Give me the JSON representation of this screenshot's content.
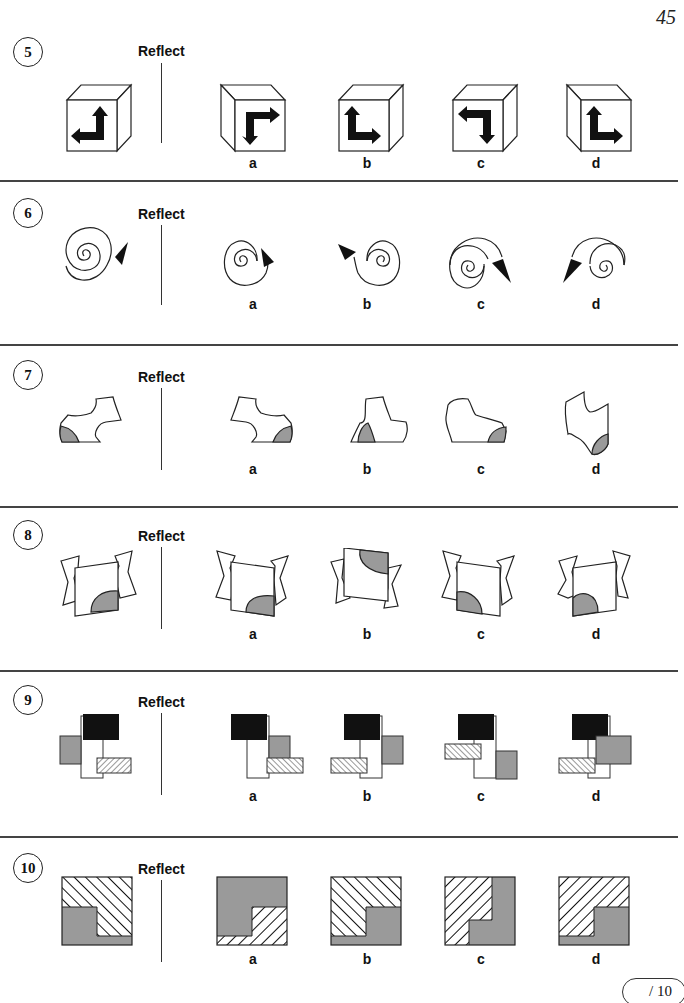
{
  "page": {
    "number": "45",
    "score_box": "/ 10"
  },
  "colors": {
    "shade_gray": "#9a9a9a",
    "black_fill": "#111111",
    "line": "#222222"
  },
  "questions": [
    {
      "number": "5",
      "instruction": "Reflect",
      "figure": "cube-with-L-arrow",
      "options": [
        {
          "label": "a"
        },
        {
          "label": "b"
        },
        {
          "label": "c"
        },
        {
          "label": "d"
        }
      ]
    },
    {
      "number": "6",
      "instruction": "Reflect",
      "figure": "spiral-with-arrowhead",
      "options": [
        {
          "label": "a"
        },
        {
          "label": "b"
        },
        {
          "label": "c"
        },
        {
          "label": "d"
        }
      ]
    },
    {
      "number": "7",
      "instruction": "Reflect",
      "figure": "curved-shape-with-shaded-corner",
      "options": [
        {
          "label": "a"
        },
        {
          "label": "b"
        },
        {
          "label": "c"
        },
        {
          "label": "d"
        }
      ]
    },
    {
      "number": "8",
      "instruction": "Reflect",
      "figure": "folded-sheet-with-quarter-circle",
      "options": [
        {
          "label": "a"
        },
        {
          "label": "b"
        },
        {
          "label": "c"
        },
        {
          "label": "d"
        }
      ]
    },
    {
      "number": "9",
      "instruction": "Reflect",
      "figure": "overlapping-rectangles",
      "options": [
        {
          "label": "a"
        },
        {
          "label": "b"
        },
        {
          "label": "c"
        },
        {
          "label": "d"
        }
      ]
    },
    {
      "number": "10",
      "instruction": "Reflect",
      "figure": "hatched-and-gray-square",
      "options": [
        {
          "label": "a"
        },
        {
          "label": "b"
        },
        {
          "label": "c"
        },
        {
          "label": "d"
        }
      ]
    }
  ]
}
